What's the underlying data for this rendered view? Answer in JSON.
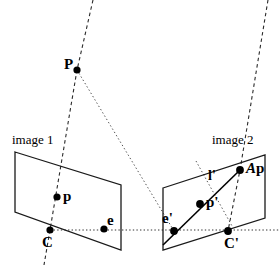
{
  "figure": {
    "background_color": "#ffffff",
    "stroke_color": "#1a1a1a",
    "point_color": "#000000",
    "width": 280,
    "height": 265
  },
  "planes": [
    {
      "id": "image-plane-1",
      "label": "image 1",
      "label_x": 12,
      "label_y": 133,
      "corners": "15,152 121,185 121,250 15,212"
    },
    {
      "id": "image-plane-2",
      "label": "image 2",
      "label_x": 212,
      "label_y": 133,
      "corners": "163,188 265,155 265,218 163,250"
    }
  ],
  "points": [
    {
      "id": "scene-point-P",
      "label": "P",
      "x": 77,
      "y": 70,
      "r": 3.6,
      "label_x": 64,
      "label_y": 59
    },
    {
      "id": "image-point-p",
      "label": "p",
      "x": 57,
      "y": 197,
      "r": 3.6,
      "label_x": 63,
      "label_y": 190
    },
    {
      "id": "camera-center-C",
      "label": "C",
      "x": 50,
      "y": 230,
      "r": 3.6,
      "label_x": 42,
      "label_y": 236
    },
    {
      "id": "epipole-e",
      "label": "e",
      "x": 104,
      "y": 229,
      "r": 3.6,
      "label_x": 107,
      "label_y": 215
    },
    {
      "id": "epipole-e-prime",
      "label": "e'",
      "x": 174,
      "y": 231,
      "r": 3.9,
      "label_x": 163,
      "label_y": 212
    },
    {
      "id": "image-point-p-prime",
      "label": "p'",
      "x": 200,
      "y": 204,
      "r": 3.9,
      "label_x": 206,
      "label_y": 196
    },
    {
      "id": "camera-center-C-prime",
      "label": "C'",
      "x": 228,
      "y": 231,
      "r": 3.9,
      "label_x": 224,
      "label_y": 237
    },
    {
      "id": "mapped-point-Ap",
      "label": "Ap",
      "x": 240,
      "y": 170,
      "r": 3.9,
      "label_x": 247,
      "label_y": 162
    }
  ],
  "line_labels": [
    {
      "id": "epipolar-line-l-prime",
      "label": "l'",
      "x": 209,
      "y": 170
    }
  ],
  "rays": {
    "dashed_ray_left": {
      "desc": "ray through C, p, P extended upward",
      "d": "M 93 0 L 77 70 L 50 230 L 44 265"
    },
    "dashed_ray_right": {
      "desc": "ray through C', Ap extended upward",
      "d": "M 268 0 L 240 170 L 228 231"
    },
    "baseline": {
      "desc": "baseline from C to C' (dotted)",
      "d": "M 50 230 L 280 230"
    },
    "epipolar_plane_edge_left": {
      "desc": "dotted line P to e' region",
      "d": "M 77 70 L 174 231"
    },
    "epipolar_plane_edge_right": {
      "desc": "dotted line from upper right through plane 2",
      "d": "M 196 161 L 232 226"
    }
  },
  "epipolar_line": {
    "id": "epipolar-line-segment",
    "desc": "solid epipolar line in image 2 through e', p', Ap",
    "d": "M 163 245 L 240 170"
  }
}
